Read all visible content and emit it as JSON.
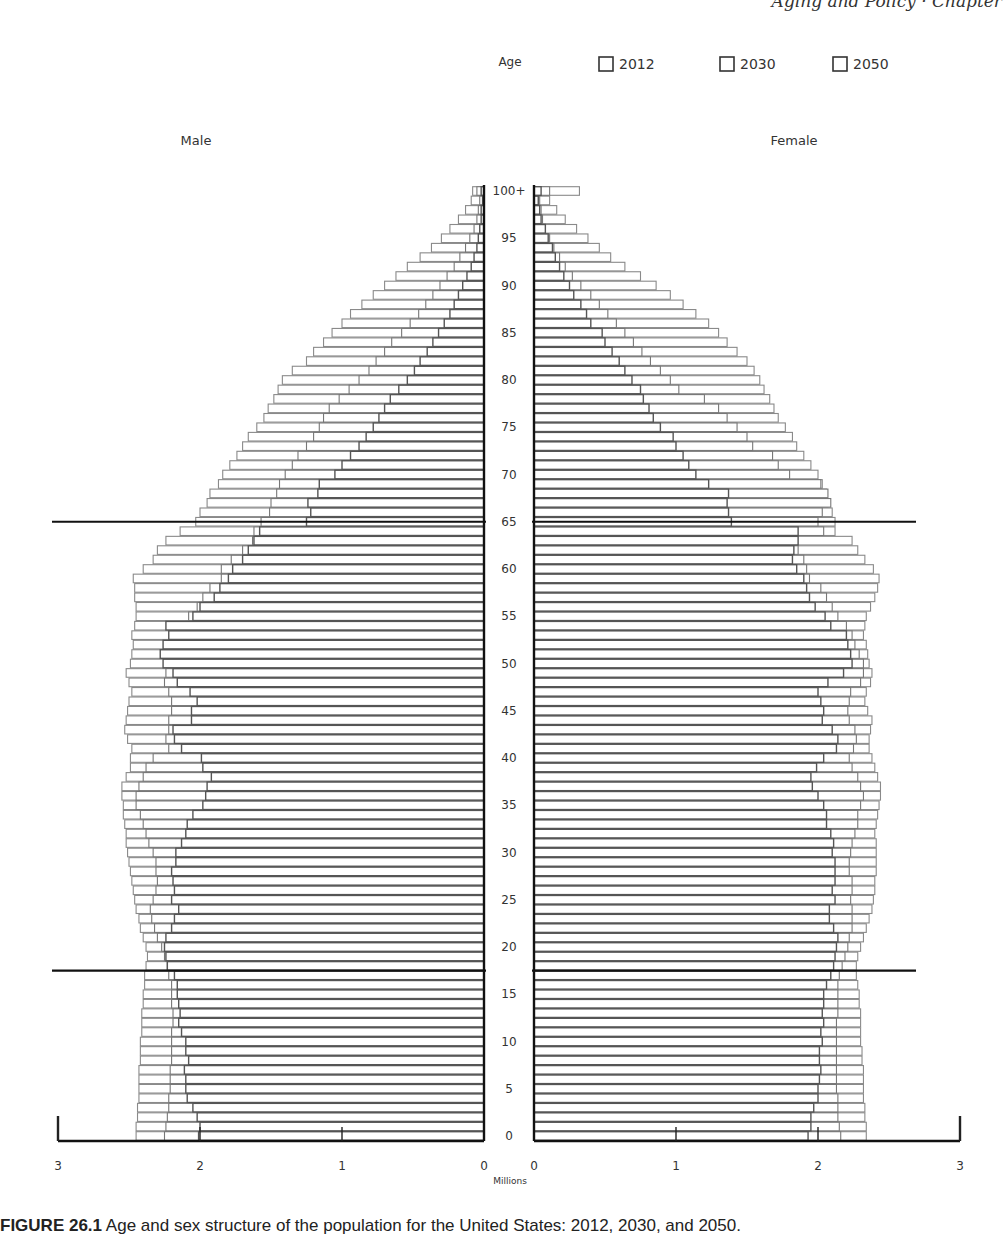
{
  "header": {
    "running_text": "Aging and Policy · Chapter"
  },
  "caption": {
    "label": "FIGURE 26.1",
    "text": "Age and sex structure of the population for the United States: 2012, 2030, and 2050."
  },
  "chart_data": {
    "type": "bar",
    "subtype": "population-pyramid",
    "title": "",
    "side_labels": {
      "left": "Male",
      "right": "Female"
    },
    "age_axis_label": "Age",
    "xlabel": "Millions",
    "ylabel": "Age",
    "age_tick_labels": [
      "0",
      "5",
      "10",
      "15",
      "20",
      "25",
      "30",
      "35",
      "40",
      "45",
      "50",
      "55",
      "60",
      "65",
      "70",
      "75",
      "80",
      "85",
      "90",
      "95",
      "100+"
    ],
    "x_tick_labels": [
      "3",
      "2",
      "1",
      "0",
      "0",
      "1",
      "2",
      "3"
    ],
    "xlim": [
      0,
      3
    ],
    "reference_lines_age": [
      17.5,
      65
    ],
    "legend": {
      "position": "top-right",
      "entries": [
        "2012",
        "2030",
        "2050"
      ]
    },
    "grid": false,
    "categories_note": "single-year ages 0..99 then 100+",
    "series": [
      {
        "name": "2012",
        "male": [
          2.01,
          2.0,
          2.02,
          2.05,
          2.09,
          2.1,
          2.1,
          2.11,
          2.08,
          2.1,
          2.1,
          2.13,
          2.15,
          2.14,
          2.15,
          2.16,
          2.16,
          2.18,
          2.23,
          2.24,
          2.25,
          2.24,
          2.2,
          2.18,
          2.15,
          2.2,
          2.18,
          2.19,
          2.2,
          2.17,
          2.17,
          2.13,
          2.1,
          2.09,
          2.05,
          1.98,
          1.96,
          1.95,
          1.92,
          1.98,
          1.99,
          2.13,
          2.18,
          2.19,
          2.06,
          2.06,
          2.02,
          2.07,
          2.16,
          2.19,
          2.26,
          2.28,
          2.26,
          2.22,
          2.24,
          2.05,
          2.0,
          1.9,
          1.86,
          1.8,
          1.77,
          1.7,
          1.66,
          1.62,
          1.58,
          1.25,
          1.22,
          1.24,
          1.17,
          1.16,
          1.05,
          1.0,
          0.94,
          0.88,
          0.83,
          0.78,
          0.74,
          0.7,
          0.66,
          0.6,
          0.54,
          0.49,
          0.45,
          0.4,
          0.36,
          0.32,
          0.28,
          0.24,
          0.21,
          0.18,
          0.15,
          0.12,
          0.09,
          0.07,
          0.05,
          0.04,
          0.03,
          0.02,
          0.02,
          0.01,
          0.02
        ],
        "female": [
          1.93,
          1.95,
          1.95,
          1.97,
          2.0,
          2.0,
          2.01,
          2.02,
          2.01,
          2.01,
          2.03,
          2.02,
          2.04,
          2.03,
          2.04,
          2.04,
          2.06,
          2.09,
          2.11,
          2.12,
          2.13,
          2.14,
          2.11,
          2.08,
          2.08,
          2.12,
          2.1,
          2.12,
          2.12,
          2.12,
          2.1,
          2.11,
          2.09,
          2.06,
          2.06,
          2.04,
          2.0,
          1.96,
          1.95,
          1.99,
          2.04,
          2.13,
          2.14,
          2.1,
          2.03,
          2.04,
          2.02,
          2.0,
          2.07,
          2.18,
          2.24,
          2.23,
          2.21,
          2.2,
          2.09,
          2.05,
          1.98,
          1.94,
          1.92,
          1.9,
          1.85,
          1.82,
          1.83,
          1.86,
          1.86,
          1.39,
          1.37,
          1.36,
          1.37,
          1.23,
          1.14,
          1.09,
          1.05,
          1.0,
          0.98,
          0.89,
          0.84,
          0.81,
          0.77,
          0.75,
          0.69,
          0.64,
          0.6,
          0.55,
          0.5,
          0.48,
          0.4,
          0.37,
          0.33,
          0.28,
          0.25,
          0.21,
          0.18,
          0.15,
          0.13,
          0.1,
          0.08,
          0.05,
          0.04,
          0.03,
          0.05
        ]
      },
      {
        "name": "2030",
        "male": [
          2.25,
          2.24,
          2.23,
          2.22,
          2.22,
          2.21,
          2.21,
          2.21,
          2.2,
          2.2,
          2.2,
          2.2,
          2.19,
          2.19,
          2.2,
          2.2,
          2.2,
          2.22,
          2.23,
          2.25,
          2.27,
          2.3,
          2.32,
          2.34,
          2.35,
          2.33,
          2.31,
          2.3,
          2.31,
          2.31,
          2.33,
          2.36,
          2.38,
          2.4,
          2.42,
          2.45,
          2.45,
          2.43,
          2.4,
          2.38,
          2.33,
          2.22,
          2.24,
          2.22,
          2.22,
          2.2,
          2.2,
          2.22,
          2.25,
          2.24,
          2.23,
          2.21,
          2.21,
          2.2,
          2.1,
          2.08,
          2.02,
          1.98,
          1.93,
          1.85,
          1.85,
          1.78,
          1.7,
          1.63,
          1.62,
          1.57,
          1.51,
          1.5,
          1.46,
          1.44,
          1.4,
          1.35,
          1.31,
          1.25,
          1.2,
          1.16,
          1.13,
          1.09,
          1.02,
          0.95,
          0.88,
          0.81,
          0.76,
          0.7,
          0.65,
          0.58,
          0.52,
          0.46,
          0.41,
          0.36,
          0.31,
          0.26,
          0.21,
          0.17,
          0.13,
          0.1,
          0.07,
          0.05,
          0.04,
          0.03,
          0.05
        ],
        "female": [
          2.16,
          2.15,
          2.14,
          2.14,
          2.14,
          2.13,
          2.13,
          2.13,
          2.13,
          2.13,
          2.13,
          2.13,
          2.13,
          2.14,
          2.14,
          2.14,
          2.14,
          2.15,
          2.17,
          2.19,
          2.21,
          2.22,
          2.24,
          2.24,
          2.24,
          2.23,
          2.24,
          2.24,
          2.22,
          2.22,
          2.23,
          2.24,
          2.26,
          2.28,
          2.28,
          2.3,
          2.32,
          2.3,
          2.28,
          2.24,
          2.22,
          2.25,
          2.27,
          2.26,
          2.22,
          2.21,
          2.22,
          2.23,
          2.3,
          2.32,
          2.32,
          2.29,
          2.26,
          2.24,
          2.2,
          2.14,
          2.1,
          2.06,
          2.02,
          1.94,
          1.92,
          1.9,
          1.86,
          1.84,
          2.04,
          2.0,
          2.03,
          2.09,
          2.07,
          2.02,
          1.8,
          1.72,
          1.68,
          1.54,
          1.5,
          1.43,
          1.36,
          1.3,
          1.2,
          1.02,
          0.96,
          0.89,
          0.82,
          0.76,
          0.7,
          0.64,
          0.58,
          0.52,
          0.46,
          0.4,
          0.33,
          0.27,
          0.22,
          0.18,
          0.14,
          0.11,
          0.08,
          0.06,
          0.05,
          0.04,
          0.11
        ]
      },
      {
        "name": "2050",
        "male": [
          2.45,
          2.45,
          2.44,
          2.44,
          2.43,
          2.43,
          2.43,
          2.43,
          2.42,
          2.42,
          2.42,
          2.41,
          2.41,
          2.41,
          2.4,
          2.4,
          2.39,
          2.39,
          2.38,
          2.37,
          2.38,
          2.4,
          2.42,
          2.43,
          2.45,
          2.46,
          2.47,
          2.48,
          2.49,
          2.5,
          2.51,
          2.52,
          2.52,
          2.53,
          2.54,
          2.54,
          2.55,
          2.55,
          2.52,
          2.49,
          2.49,
          2.48,
          2.51,
          2.53,
          2.52,
          2.51,
          2.5,
          2.48,
          2.5,
          2.52,
          2.49,
          2.48,
          2.47,
          2.48,
          2.46,
          2.45,
          2.45,
          2.46,
          2.46,
          2.47,
          2.4,
          2.33,
          2.3,
          2.24,
          2.14,
          2.03,
          2.0,
          1.95,
          1.93,
          1.87,
          1.84,
          1.79,
          1.74,
          1.7,
          1.66,
          1.6,
          1.55,
          1.52,
          1.48,
          1.45,
          1.42,
          1.35,
          1.25,
          1.2,
          1.13,
          1.07,
          1.0,
          0.94,
          0.86,
          0.78,
          0.7,
          0.62,
          0.54,
          0.45,
          0.37,
          0.3,
          0.24,
          0.18,
          0.13,
          0.09,
          0.08
        ],
        "female": [
          2.34,
          2.34,
          2.33,
          2.33,
          2.32,
          2.32,
          2.32,
          2.32,
          2.31,
          2.31,
          2.3,
          2.3,
          2.3,
          2.3,
          2.29,
          2.29,
          2.28,
          2.27,
          2.27,
          2.28,
          2.3,
          2.32,
          2.34,
          2.36,
          2.38,
          2.39,
          2.4,
          2.4,
          2.41,
          2.41,
          2.41,
          2.41,
          2.4,
          2.41,
          2.42,
          2.43,
          2.44,
          2.44,
          2.42,
          2.4,
          2.38,
          2.36,
          2.36,
          2.37,
          2.38,
          2.35,
          2.33,
          2.34,
          2.37,
          2.38,
          2.36,
          2.35,
          2.34,
          2.32,
          2.33,
          2.34,
          2.37,
          2.4,
          2.42,
          2.43,
          2.39,
          2.33,
          2.28,
          2.24,
          2.12,
          2.12,
          2.1,
          2.07,
          2.06,
          2.03,
          2.0,
          1.95,
          1.9,
          1.85,
          1.82,
          1.77,
          1.72,
          1.69,
          1.66,
          1.62,
          1.59,
          1.55,
          1.5,
          1.43,
          1.36,
          1.3,
          1.23,
          1.14,
          1.05,
          0.96,
          0.86,
          0.75,
          0.64,
          0.54,
          0.46,
          0.38,
          0.3,
          0.22,
          0.16,
          0.11,
          0.32
        ]
      }
    ]
  }
}
